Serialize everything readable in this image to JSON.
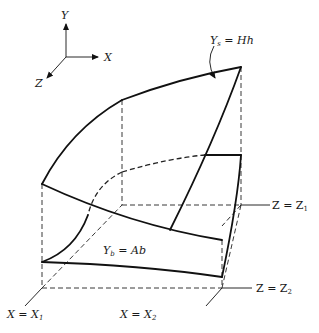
{
  "axes": {
    "y_label": "Y",
    "x_label": "X",
    "z_label": "Z"
  },
  "labels": {
    "top_surface": {
      "main": "Y",
      "sub": "s",
      "rest": " = Hh"
    },
    "bottom_surface": {
      "main": "Y",
      "sub": "b",
      "rest": " = Ab"
    },
    "z1": {
      "main": "Z = Z",
      "sub": "1"
    },
    "z2": {
      "main": "Z = Z",
      "sub": "2"
    },
    "x1": {
      "main": "X = X",
      "sub": "1"
    },
    "x2": {
      "main": "X = X",
      "sub": "2"
    }
  },
  "colors": {
    "ink": "#111111",
    "background": "#ffffff"
  }
}
